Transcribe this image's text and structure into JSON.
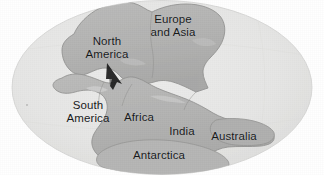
{
  "figure": {
    "projection": "elliptical",
    "width": 324,
    "height": 175
  },
  "colors": {
    "page_background": "#ffffff",
    "ocean": "#e7e7e6",
    "ocean_edge": "#dcdcda",
    "land": "#b4b4b3",
    "land_shadow": "#a7a7a6",
    "coastline": "#8e8e8d",
    "label_text": "#17191b",
    "cursor": "#1b1b1b"
  },
  "labels": [
    {
      "id": "north-america",
      "text": "North\nAmerica",
      "x": 107,
      "y": 48
    },
    {
      "id": "europe-and-asia",
      "text": "Europe\nand Asia",
      "x": 173,
      "y": 26
    },
    {
      "id": "south-america",
      "text": "South\nAmerica",
      "x": 88,
      "y": 112
    },
    {
      "id": "africa",
      "text": "Africa",
      "x": 139,
      "y": 117
    },
    {
      "id": "india",
      "text": "India",
      "x": 182,
      "y": 131
    },
    {
      "id": "australia",
      "text": "Australia",
      "x": 234,
      "y": 136
    },
    {
      "id": "antarctica",
      "text": "Antarctica",
      "x": 159,
      "y": 155
    }
  ],
  "cursor": {
    "name": "mouse-pointer",
    "x": 113,
    "y": 72,
    "description": "dark arrow pointer over the boundary between North America and Africa"
  },
  "speck": {
    "x": 27,
    "y": 105
  }
}
